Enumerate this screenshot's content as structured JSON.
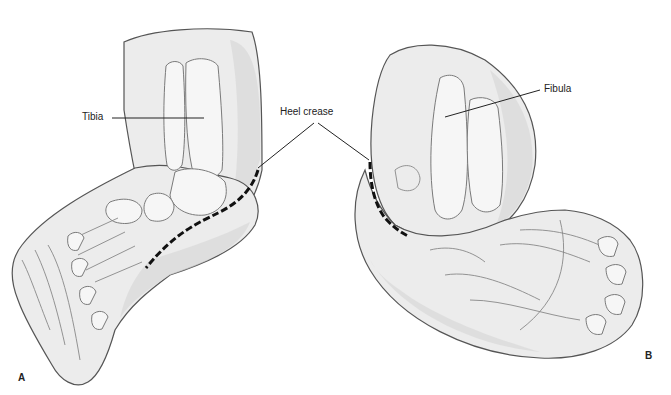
{
  "figure": {
    "panels": [
      {
        "id": "A",
        "letter": "A",
        "view": "anterior-medial view of clubfoot"
      },
      {
        "id": "B",
        "letter": "B",
        "view": "posterior-lateral view of clubfoot"
      }
    ],
    "labels": {
      "tibia": "Tibia",
      "heel_crease": "Heel crease",
      "fibula": "Fibula"
    }
  }
}
